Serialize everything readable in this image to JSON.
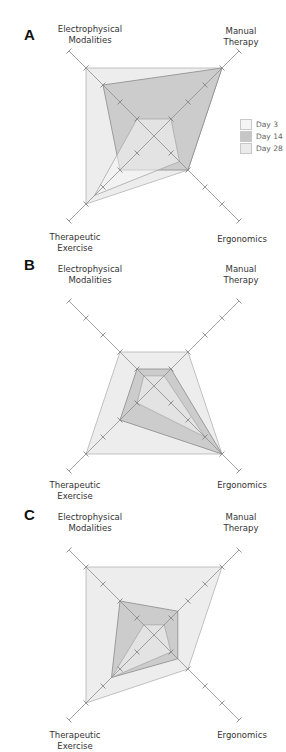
{
  "header": {
    "text": ""
  },
  "legend": {
    "items": [
      {
        "label": "Day 3",
        "color": "#f5f5f5"
      },
      {
        "label": "Day 14",
        "color": "#c6c6c6"
      },
      {
        "label": "Day 28",
        "color": "#ebebeb"
      }
    ]
  },
  "axes": [
    "Electrophysical Modalities",
    "Manual Therapy",
    "Ergonomics",
    "Therapeutic Exercise"
  ],
  "labels": {
    "em_line1": "Electrophysical",
    "em_line2": "Modalities",
    "mt_line1": "Manual",
    "mt_line2": "Therapy",
    "te_line1": "Therapeutic",
    "te_line2": "Exercise",
    "ergo": "Ergonomics"
  },
  "panels": [
    {
      "letter": "A"
    },
    {
      "letter": "B"
    },
    {
      "letter": "C"
    }
  ],
  "chart_data": [
    {
      "type": "radar",
      "title": "A",
      "axes": [
        "Electrophysical Modalities",
        "Manual Therapy",
        "Ergonomics",
        "Therapeutic Exercise"
      ],
      "rmax": 5,
      "ticks": [
        1,
        2,
        3,
        4,
        5
      ],
      "series": [
        {
          "name": "Day 28",
          "values": [
            4,
            4,
            2,
            4
          ]
        },
        {
          "name": "Day 14",
          "values": [
            3,
            4,
            2,
            2
          ]
        },
        {
          "name": "Day 3",
          "values": [
            1,
            1,
            1.5,
            3.5
          ]
        }
      ],
      "legend_position": "right"
    },
    {
      "type": "radar",
      "title": "B",
      "axes": [
        "Electrophysical Modalities",
        "Manual Therapy",
        "Ergonomics",
        "Therapeutic Exercise"
      ],
      "rmax": 5,
      "ticks": [
        1,
        2,
        3,
        4,
        5
      ],
      "series": [
        {
          "name": "Day 28",
          "values": [
            2,
            2,
            4,
            4
          ]
        },
        {
          "name": "Day 14",
          "values": [
            1,
            1,
            4,
            2
          ]
        },
        {
          "name": "Day 3",
          "values": [
            0.6,
            0.6,
            3,
            1
          ]
        }
      ]
    },
    {
      "type": "radar",
      "title": "C",
      "axes": [
        "Electrophysical Modalities",
        "Manual Therapy",
        "Ergonomics",
        "Therapeutic Exercise"
      ],
      "rmax": 5,
      "ticks": [
        1,
        2,
        3,
        4,
        5
      ],
      "series": [
        {
          "name": "Day 28",
          "values": [
            4,
            4,
            2,
            4
          ]
        },
        {
          "name": "Day 14",
          "values": [
            2,
            1.4,
            1.4,
            2.5
          ]
        },
        {
          "name": "Day 3",
          "values": [
            0.6,
            0.6,
            1,
            2.5
          ]
        }
      ]
    }
  ]
}
